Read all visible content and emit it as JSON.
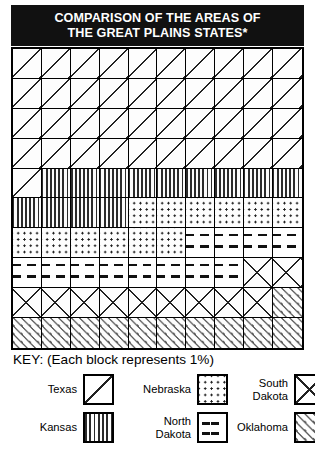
{
  "title": {
    "line1": "COMPARISON OF THE AREAS OF",
    "line2": "THE GREAT PLAINS STATES*"
  },
  "legend": {
    "key_text": "KEY: (Each block represents 1%)",
    "items": [
      {
        "label": "Texas",
        "pattern": "diagonal-backslash",
        "key": "texas"
      },
      {
        "label": "Kansas",
        "pattern": "vertical-lines",
        "key": "kansas"
      },
      {
        "label": "Nebraska",
        "pattern": "dot-grid",
        "key": "nebraska"
      },
      {
        "label": "North\nDakota",
        "pattern": "horizontal-dashes",
        "key": "ndakota"
      },
      {
        "label": "South\nDakota",
        "pattern": "cross-hatch-x",
        "key": "sdakota"
      },
      {
        "label": "Oklahoma",
        "pattern": "short-slashes",
        "key": "oklahoma"
      }
    ]
  },
  "chart_data": {
    "type": "bar",
    "subtype": "waffle-grid",
    "title": "COMPARISON OF THE AREAS OF THE GREAT PLAINS STATES*",
    "unit": "percent",
    "unit_note": "Each block represents 1%",
    "grid": {
      "columns": 10,
      "rows": 10,
      "total_blocks": 100
    },
    "categories": [
      "Texas",
      "Kansas",
      "Nebraska",
      "North Dakota",
      "South Dakota",
      "Oklahoma"
    ],
    "values": [
      41,
      13,
      12,
      12,
      11,
      11
    ],
    "xlabel": "",
    "ylabel": "",
    "legend_position": "bottom",
    "grid_lines": true,
    "cell_sequence": [
      "texas",
      "texas",
      "texas",
      "texas",
      "texas",
      "texas",
      "texas",
      "texas",
      "texas",
      "texas",
      "texas",
      "texas",
      "texas",
      "texas",
      "texas",
      "texas",
      "texas",
      "texas",
      "texas",
      "texas",
      "texas",
      "texas",
      "texas",
      "texas",
      "texas",
      "texas",
      "texas",
      "texas",
      "texas",
      "texas",
      "texas",
      "texas",
      "texas",
      "texas",
      "texas",
      "texas",
      "texas",
      "texas",
      "texas",
      "texas",
      "texas",
      "kansas",
      "kansas",
      "kansas",
      "kansas",
      "kansas",
      "kansas",
      "kansas",
      "kansas",
      "kansas",
      "kansas",
      "kansas",
      "kansas",
      "kansas",
      "nebraska",
      "nebraska",
      "nebraska",
      "nebraska",
      "nebraska",
      "nebraska",
      "nebraska",
      "nebraska",
      "nebraska",
      "nebraska",
      "nebraska",
      "nebraska",
      "ndakota",
      "ndakota",
      "ndakota",
      "ndakota",
      "ndakota",
      "ndakota",
      "ndakota",
      "ndakota",
      "ndakota",
      "ndakota",
      "ndakota",
      "ndakota",
      "sdakota",
      "sdakota",
      "sdakota",
      "sdakota",
      "sdakota",
      "sdakota",
      "sdakota",
      "sdakota",
      "sdakota",
      "sdakota",
      "sdakota",
      "oklahoma",
      "oklahoma",
      "oklahoma",
      "oklahoma",
      "oklahoma",
      "oklahoma",
      "oklahoma",
      "oklahoma",
      "oklahoma",
      "oklahoma",
      "oklahoma"
    ]
  },
  "colors": {
    "banner_background": "#111111",
    "banner_text": "#ffffff",
    "grid_line": "#000000",
    "cell_background": "#fdfdfd",
    "pattern_ink": "#222222"
  }
}
